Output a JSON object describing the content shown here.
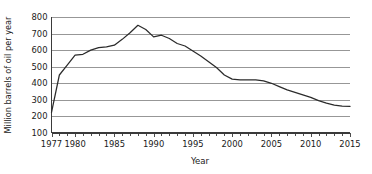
{
  "chart_data": {
    "type": "line",
    "title": "",
    "xlabel": "Year",
    "ylabel": "Million barrels of oil per year",
    "xlim": [
      1977,
      2015
    ],
    "ylim": [
      100,
      800
    ],
    "grid": true,
    "legend": null,
    "y_ticks": [
      100,
      200,
      300,
      400,
      500,
      600,
      700,
      800
    ],
    "y_tick_labels": [
      "100",
      "200",
      "300",
      "400",
      "500",
      "600",
      "700",
      "800"
    ],
    "x_ticks": [
      1977,
      1980,
      1985,
      1990,
      1995,
      2000,
      2005,
      2010,
      2015
    ],
    "x_tick_labels": [
      "1977",
      "1980",
      "1985",
      "1990",
      "1995",
      "2000",
      "2005",
      "2010",
      "2015"
    ],
    "x_minor_tick_step": 1,
    "series": [
      {
        "name": "Oil production",
        "x": [
          1977,
          1978,
          1979,
          1980,
          1981,
          1982,
          1983,
          1984,
          1985,
          1986,
          1987,
          1988,
          1989,
          1990,
          1991,
          1992,
          1993,
          1994,
          1995,
          1996,
          1997,
          1998,
          1999,
          2000,
          2001,
          2002,
          2003,
          2004,
          2005,
          2006,
          2007,
          2008,
          2009,
          2010,
          2011,
          2012,
          2013,
          2014,
          2015
        ],
        "y": [
          225,
          450,
          510,
          570,
          575,
          600,
          615,
          620,
          630,
          665,
          705,
          750,
          725,
          680,
          690,
          670,
          640,
          625,
          595,
          565,
          530,
          495,
          450,
          425,
          420,
          420,
          420,
          415,
          400,
          380,
          360,
          345,
          330,
          315,
          295,
          280,
          268,
          262,
          260
        ]
      }
    ]
  },
  "axes": {
    "y_axis_title": "Million barrels of oil per year",
    "x_axis_title": "Year"
  },
  "colors": {
    "line": "#2b2b2b",
    "grid": "#8c8c8c",
    "axis": "#3a3a3a",
    "text": "#1a1a1a",
    "background": "#ffffff"
  }
}
